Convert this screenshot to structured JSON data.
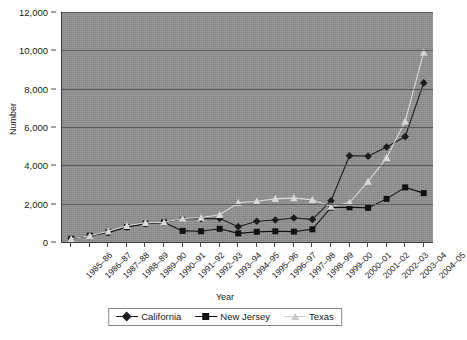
{
  "chart_data": {
    "type": "line",
    "title": "",
    "xlabel": "Year",
    "ylabel": "Number",
    "grid": true,
    "legend_position": "bottom",
    "ylim": [
      0,
      12000
    ],
    "ytick_step": 2000,
    "ytick_labels": [
      "12,000",
      "10,000",
      "8,000",
      "6,000",
      "4,000",
      "2,000",
      "0"
    ],
    "ytick_values": [
      12000,
      10000,
      8000,
      6000,
      4000,
      2000,
      0
    ],
    "categories": [
      "1985–86",
      "1986–87",
      "1987–88",
      "1988–89",
      "1989–90",
      "1990–91",
      "1991–92",
      "1992–93",
      "1993–94",
      "1994–95",
      "1995–96",
      "1996–97",
      "1997–98",
      "1998–99",
      "1999–00",
      "2000–01",
      "2001–02",
      "2002–03",
      "2003–04",
      "2004–05"
    ],
    "series": [
      {
        "name": "California",
        "marker": "diamond",
        "color": "#1c1c1c",
        "values": [
          170,
          330,
          500,
          780,
          960,
          1020,
          1210,
          1220,
          1230,
          800,
          1080,
          1150,
          1250,
          1180,
          2150,
          4500,
          4480,
          4960,
          5500,
          8300
        ]
      },
      {
        "name": "New Jersey",
        "marker": "square",
        "color": "#111111",
        "values": [
          170,
          330,
          500,
          780,
          960,
          1020,
          580,
          560,
          690,
          450,
          530,
          560,
          540,
          660,
          1800,
          1810,
          1780,
          2250,
          2850,
          2550
        ]
      },
      {
        "name": "Texas",
        "marker": "triangle",
        "color": "#d8d8d8",
        "values": [
          170,
          330,
          560,
          850,
          1000,
          1030,
          1230,
          1280,
          1420,
          2050,
          2130,
          2250,
          2300,
          2200,
          1850,
          2060,
          3150,
          4400,
          6300,
          9900
        ]
      }
    ]
  },
  "legend": {
    "items": [
      {
        "label": "California",
        "marker": "diamond-marker",
        "color": "#1c1c1c"
      },
      {
        "label": "New Jersey",
        "marker": "square-marker",
        "color": "#111111"
      },
      {
        "label": "Texas",
        "marker": "triangle-marker",
        "color": "#c9c9c9"
      }
    ]
  },
  "style": {
    "plot_background": "#8e8e8e",
    "gridline_color": "#5a5a5a",
    "axis_color": "#3c3c3c",
    "page_background": "#ffffff"
  }
}
